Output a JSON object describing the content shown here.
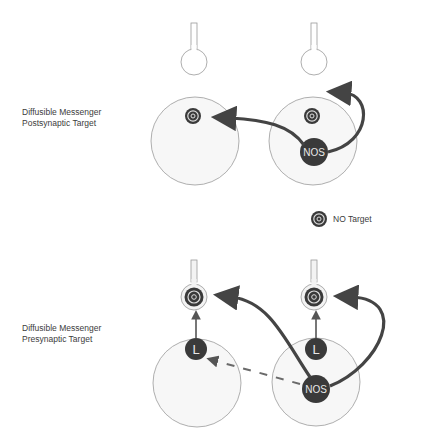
{
  "panels": [
    {
      "id": "postsynaptic",
      "label_line1": "Diffusible Messenger",
      "label_line2": "Postsynaptic Target"
    },
    {
      "id": "presynaptic",
      "label_line1": "Diffusible Messenger",
      "label_line2": "Presynaptic Target"
    }
  ],
  "legend": {
    "icon": "no-target-icon",
    "label": "NO Target"
  },
  "nodes": {
    "nos_label": "NOS",
    "l_label": "L"
  },
  "colors": {
    "cell_fill": "#f6f6f6",
    "cell_stroke": "#9a9a9a",
    "dark_node": "#3a3a3a",
    "arrow": "#444444",
    "dashed": "#6a6a6a"
  }
}
